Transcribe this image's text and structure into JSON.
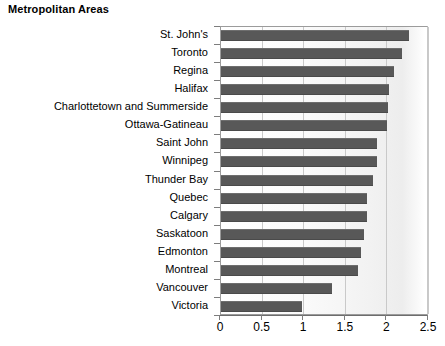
{
  "chart_data": {
    "type": "bar",
    "orientation": "horizontal",
    "title": "Metropolitan Areas",
    "xlabel": "",
    "ylabel": "",
    "xlim": [
      0,
      2.5
    ],
    "xticks": [
      "0",
      "0.5",
      "1",
      "1.5",
      "2",
      "2.5"
    ],
    "xtick_values": [
      0,
      0.5,
      1,
      1.5,
      2,
      2.5
    ],
    "grid": true,
    "legend": false,
    "bar_color": "#585858",
    "categories": [
      "St. John's",
      "Toronto",
      "Regina",
      "Halifax",
      "Charlottetown and Summerside",
      "Ottawa-Gatineau",
      "Saint John",
      "Winnipeg",
      "Thunder Bay",
      "Quebec",
      "Calgary",
      "Saskatoon",
      "Edmonton",
      "Montreal",
      "Vancouver",
      "Victoria"
    ],
    "values": [
      2.26,
      2.18,
      2.08,
      2.02,
      2.01,
      1.99,
      1.88,
      1.87,
      1.83,
      1.76,
      1.75,
      1.72,
      1.68,
      1.65,
      1.33,
      0.97
    ]
  }
}
